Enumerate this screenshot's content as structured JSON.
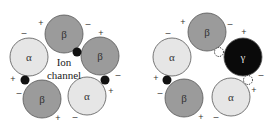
{
  "colors": {
    "alpha": "#e6e6e6",
    "beta": "#9b9b9b",
    "gamma": "#0a0a0a",
    "stroke": "#555555",
    "site": "#111111"
  },
  "left_diagram": {
    "center_label_line1": "Ion",
    "center_label_line2": "channel",
    "subunits": [
      {
        "label": "β",
        "type": "beta",
        "cx": 64,
        "cy": 34
      },
      {
        "label": "β",
        "type": "beta",
        "cx": 100,
        "cy": 56
      },
      {
        "label": "α",
        "type": "alpha",
        "cx": 87,
        "cy": 96
      },
      {
        "label": "β",
        "type": "beta",
        "cx": 42,
        "cy": 99
      },
      {
        "label": "α",
        "type": "alpha",
        "cx": 29,
        "cy": 57
      }
    ],
    "sites": [
      {
        "cx": 77,
        "cy": 52,
        "filled": true
      },
      {
        "cx": 105,
        "cy": 80,
        "filled": true
      },
      {
        "cx": 25,
        "cy": 80,
        "filled": true
      }
    ],
    "signs": [
      {
        "text": "+",
        "x": 41,
        "y": 23
      },
      {
        "text": "–",
        "x": 88,
        "y": 24
      },
      {
        "text": "+",
        "x": 101,
        "y": 33
      },
      {
        "text": "–",
        "x": 24,
        "y": 33
      },
      {
        "text": "–",
        "x": 118,
        "y": 75
      },
      {
        "text": "+",
        "x": 111,
        "y": 91
      },
      {
        "text": "+",
        "x": 13,
        "y": 79
      },
      {
        "text": "–",
        "x": 19,
        "y": 93
      },
      {
        "text": "+",
        "x": 58,
        "y": 118
      },
      {
        "text": "–",
        "x": 75,
        "y": 117
      }
    ]
  },
  "right_diagram": {
    "subunits": [
      {
        "label": "β",
        "type": "beta",
        "cx": 207,
        "cy": 32
      },
      {
        "label": "γ",
        "type": "gamma",
        "cx": 243,
        "cy": 57
      },
      {
        "label": "α",
        "type": "alpha",
        "cx": 231,
        "cy": 97
      },
      {
        "label": "β",
        "type": "beta",
        "cx": 184,
        "cy": 98
      },
      {
        "label": "α",
        "type": "alpha",
        "cx": 172,
        "cy": 57
      }
    ],
    "sites": [
      {
        "cx": 219,
        "cy": 52,
        "filled": false
      },
      {
        "cx": 248,
        "cy": 80,
        "filled": false
      },
      {
        "cx": 167,
        "cy": 80,
        "filled": true
      }
    ],
    "signs": [
      {
        "text": "+",
        "x": 183,
        "y": 22
      },
      {
        "text": "–",
        "x": 230,
        "y": 24
      },
      {
        "text": "+",
        "x": 244,
        "y": 32
      },
      {
        "text": "–",
        "x": 168,
        "y": 33
      },
      {
        "text": "–",
        "x": 261,
        "y": 75
      },
      {
        "text": "+",
        "x": 254,
        "y": 90
      },
      {
        "text": "+",
        "x": 156,
        "y": 78
      },
      {
        "text": "–",
        "x": 160,
        "y": 93
      },
      {
        "text": "+",
        "x": 201,
        "y": 117
      },
      {
        "text": "–",
        "x": 216,
        "y": 117
      }
    ]
  }
}
